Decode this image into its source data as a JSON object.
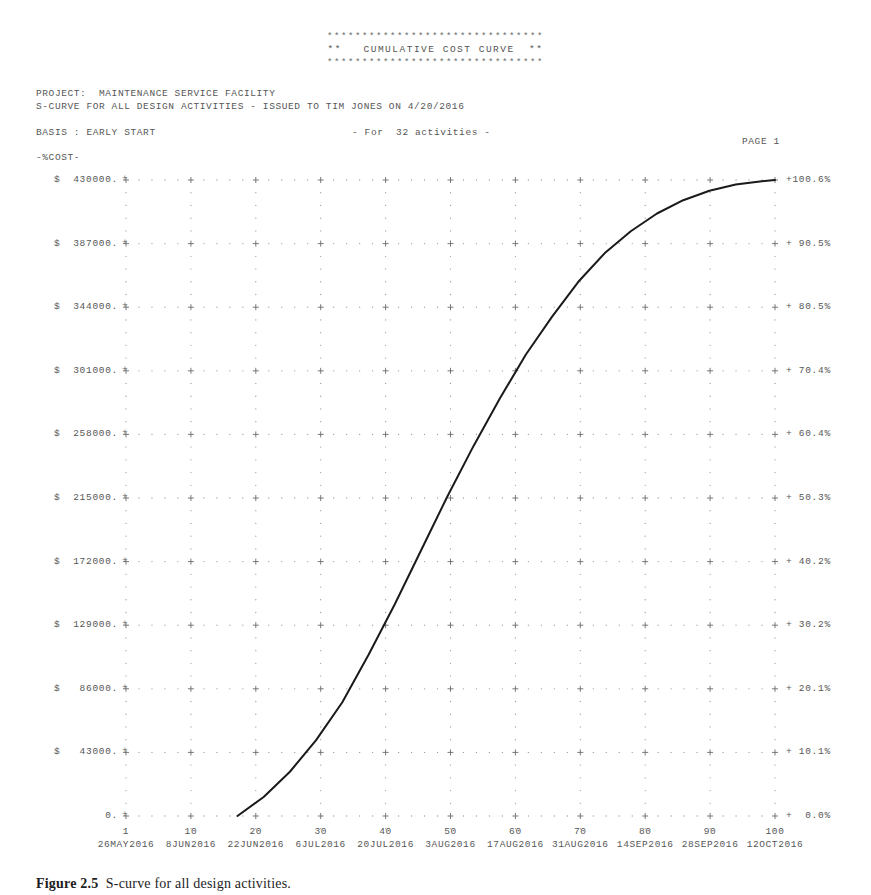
{
  "banner": {
    "stars": "*******************************",
    "title": "**   CUMULATIVE COST CURVE  **"
  },
  "header": {
    "project_line": "PROJECT:  MAINTENANCE SERVICE FACILITY",
    "subtitle_line": "S-CURVE FOR ALL DESIGN ACTIVITIES - ISSUED TO TIM JONES ON 4/20/2016",
    "basis_line": "BASIS : EARLY START",
    "activities_line": "- For  32 activities -",
    "page_label": "PAGE 1",
    "cost_axis_label": "-%COST-"
  },
  "caption": {
    "figure_number": "Figure 2.5",
    "text": "  S-curve for all design activities."
  },
  "chart_data": {
    "type": "line",
    "title": "**   CUMULATIVE COST CURVE  **",
    "xlabel": "",
    "ylabel": "-%COST-",
    "grid": true,
    "legend": "none",
    "ylim": [
      0,
      430000
    ],
    "xlim": [
      0,
      100
    ],
    "y_ticks": [
      "$  430000.",
      "$  387000.",
      "$  344000.",
      "$  301000.",
      "$  258000.",
      "$  215000.",
      "$  172000.",
      "$  129000.",
      "$   86000.",
      "$   43000.",
      "        0."
    ],
    "y_tick_values": [
      430000,
      387000,
      344000,
      301000,
      258000,
      215000,
      172000,
      129000,
      86000,
      43000,
      0
    ],
    "pct_ticks": [
      "+100.6%",
      "+ 90.5%",
      "+ 80.5%",
      "+ 70.4%",
      "+ 60.4%",
      "+ 50.3%",
      "+ 40.2%",
      "+ 30.2%",
      "+ 20.1%",
      "+ 10.1%",
      "+  0.0%"
    ],
    "pct_tick_values": [
      100.6,
      90.5,
      80.5,
      70.4,
      60.4,
      50.3,
      40.2,
      30.2,
      20.1,
      10.1,
      0.0
    ],
    "x_tick_numbers": [
      "1",
      "10",
      "20",
      "30",
      "40",
      "50",
      "60",
      "70",
      "80",
      "90",
      "100"
    ],
    "x_tick_values": [
      1,
      10,
      20,
      30,
      40,
      50,
      60,
      70,
      80,
      90,
      100
    ],
    "x_tick_dates": [
      "26MAY2016",
      "8JUN2016",
      "22JUN2016",
      "6JUL2016",
      "20JUL2016",
      "3AUG2016",
      "17AUG2016",
      "31AUG2016",
      "14SEP2016",
      "28SEP2016",
      "12OCT2016"
    ],
    "series": [
      {
        "name": "Cumulative cost",
        "x": [
          18,
          22,
          26,
          30,
          34,
          38,
          42,
          46,
          50,
          54,
          58,
          62,
          66,
          70,
          74,
          78,
          82,
          86,
          90,
          94,
          98,
          100
        ],
        "percent": [
          0.0,
          3.0,
          7.0,
          12.0,
          18.0,
          25.5,
          33.5,
          42.0,
          50.5,
          58.5,
          66.0,
          73.0,
          79.0,
          84.5,
          89.0,
          92.5,
          95.3,
          97.4,
          98.9,
          99.9,
          100.4,
          100.6
        ],
        "values": [
          0,
          12800,
          29900,
          51300,
          76900,
          108900,
          143100,
          179400,
          215700,
          249900,
          281900,
          311800,
          337400,
          360900,
          380100,
          395100,
          407000,
          416000,
          422400,
          426700,
          428800,
          430000
        ]
      }
    ],
    "curve_style": {
      "color": "#1a1a1a",
      "width": 2.0
    },
    "grid_style": {
      "dot_color": "#9d9d9d",
      "plus_color": "#6b6b6b"
    }
  }
}
